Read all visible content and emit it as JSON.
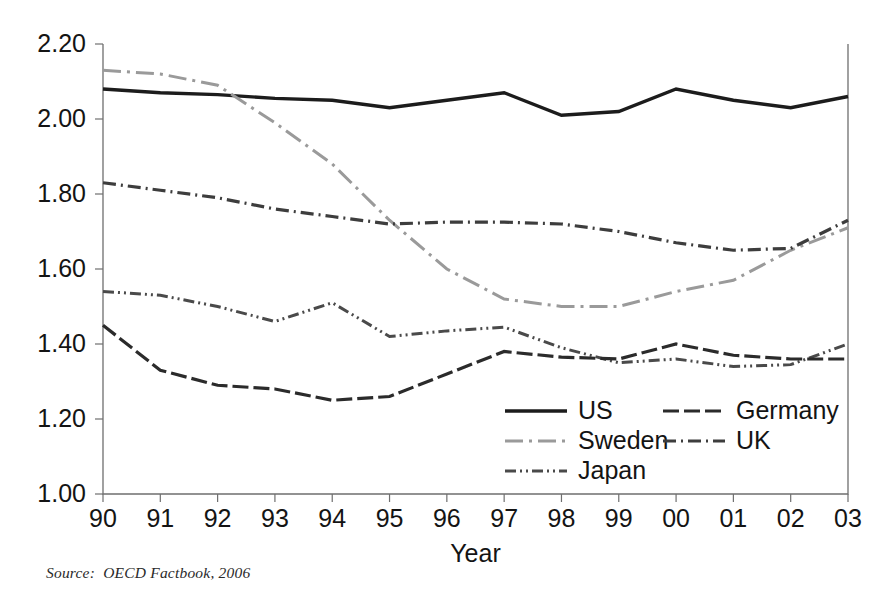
{
  "source_note": "Source:  OECD Factbook, 2006",
  "axis": {
    "x_title": "Year",
    "y_ticks": [
      "1.00",
      "1.20",
      "1.40",
      "1.60",
      "1.80",
      "2.00",
      "2.20"
    ],
    "x_ticks": [
      "90",
      "91",
      "92",
      "93",
      "94",
      "95",
      "96",
      "97",
      "98",
      "99",
      "00",
      "01",
      "02",
      "03"
    ]
  },
  "legend": {
    "items": [
      {
        "label": "US",
        "key": "us"
      },
      {
        "label": "Germany",
        "key": "germany"
      },
      {
        "label": "Sweden",
        "key": "sweden"
      },
      {
        "label": "UK",
        "key": "uk"
      },
      {
        "label": "Japan",
        "key": "japan"
      }
    ]
  },
  "chart_data": {
    "type": "line",
    "title": "",
    "subtitle": "",
    "xlabel": "Year",
    "ylabel": "",
    "xlim": [
      0,
      13
    ],
    "ylim": [
      1.0,
      2.2
    ],
    "ytick_values": [
      1.0,
      1.2,
      1.4,
      1.6,
      1.8,
      2.0,
      2.2
    ],
    "grid": false,
    "legend_position": "inside-bottom-center",
    "categories": [
      "90",
      "91",
      "92",
      "93",
      "94",
      "95",
      "96",
      "97",
      "98",
      "99",
      "00",
      "01",
      "02",
      "03"
    ],
    "series": [
      {
        "name": "US",
        "key": "us",
        "color": "#1c1c1c",
        "stroke_width": 3.4,
        "dash": "none",
        "values": [
          2.08,
          2.07,
          2.065,
          2.055,
          2.05,
          2.03,
          2.05,
          2.07,
          2.01,
          2.02,
          2.08,
          2.05,
          2.03,
          2.06
        ]
      },
      {
        "name": "Sweden",
        "key": "sweden",
        "color": "#9a9a9a",
        "stroke_width": 3.0,
        "dash": "18,6,3,6",
        "values": [
          2.13,
          2.12,
          2.09,
          1.99,
          1.88,
          1.73,
          1.6,
          1.52,
          1.5,
          1.5,
          1.54,
          1.57,
          1.65,
          1.71
        ]
      },
      {
        "name": "UK",
        "key": "uk",
        "color": "#3d3d3d",
        "stroke_width": 3.2,
        "dash": "13,5,2,5",
        "values": [
          1.83,
          1.81,
          1.79,
          1.76,
          1.74,
          1.72,
          1.725,
          1.725,
          1.72,
          1.7,
          1.67,
          1.65,
          1.655,
          1.73
        ]
      },
      {
        "name": "Japan",
        "key": "japan",
        "color": "#4a4a4a",
        "stroke_width": 3.0,
        "dash": "11,4,2,4,2,4",
        "values": [
          1.54,
          1.53,
          1.5,
          1.46,
          1.51,
          1.42,
          1.435,
          1.445,
          1.39,
          1.35,
          1.36,
          1.34,
          1.345,
          1.4
        ]
      },
      {
        "name": "Germany",
        "key": "germany",
        "color": "#2b2b2b",
        "stroke_width": 3.2,
        "dash": "16,5",
        "values": [
          1.45,
          1.33,
          1.29,
          1.28,
          1.25,
          1.26,
          1.32,
          1.38,
          1.365,
          1.36,
          1.4,
          1.37,
          1.36,
          1.36
        ]
      }
    ]
  },
  "plot_geometry": {
    "left": 103,
    "right": 848,
    "top": 44,
    "bottom": 494
  },
  "legend_geometry": {
    "col1_line_x": 505,
    "col1_text_x": 578,
    "col2_line_x": 663,
    "col2_text_x": 736,
    "row1_y": 411,
    "row2_y": 441,
    "row3_y": 471,
    "sample_len": 62
  }
}
